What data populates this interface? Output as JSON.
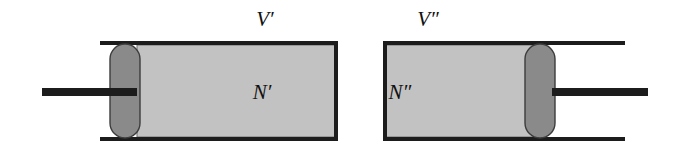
{
  "figure": {
    "name": "two-piston-cylinder-systems",
    "background_color": "#ffffff"
  },
  "labels": {
    "left_volume": "V′",
    "left_amount": "N′",
    "right_volume": "V″",
    "right_amount": "N″"
  },
  "colors": {
    "gas_fill": "#c2c2c2",
    "piston_fill": "#8a8a8a",
    "wall_stroke": "#1c1c1c",
    "rod_fill": "#1c1c1c",
    "gas_edge": "#3a3a3a",
    "piston_edge": "#3c3c3c",
    "text": "#111111"
  },
  "left_assembly": {
    "name": "left-piston-cylinder",
    "cylinder": {
      "x": 100,
      "y": 41,
      "width": 238,
      "height": 100,
      "wall_thickness": 4
    },
    "gas_region": {
      "x": 137,
      "y": 45,
      "width": 198,
      "height": 92
    },
    "piston": {
      "x": 110,
      "y": 44,
      "width": 30,
      "height": 94,
      "corner_radius": 15
    },
    "rod": {
      "x": 42,
      "y": 88,
      "width": 95,
      "height": 8
    },
    "closed_end": "right",
    "rod_direction": "left",
    "volume_label_pos": {
      "x": 265,
      "y": 26
    },
    "amount_label_pos": {
      "x": 262,
      "y": 99
    }
  },
  "right_assembly": {
    "name": "right-piston-cylinder",
    "cylinder": {
      "x": 383,
      "y": 41,
      "width": 242,
      "height": 100,
      "wall_thickness": 4
    },
    "gas_region": {
      "x": 386,
      "y": 45,
      "width": 147,
      "height": 92
    },
    "piston": {
      "x": 525,
      "y": 44,
      "width": 30,
      "height": 94,
      "corner_radius": 15
    },
    "rod": {
      "x": 552,
      "y": 88,
      "width": 96,
      "height": 8
    },
    "closed_end": "left",
    "rod_direction": "right",
    "volume_label_pos": {
      "x": 428,
      "y": 26
    },
    "amount_label_pos": {
      "x": 400,
      "y": 99
    }
  }
}
